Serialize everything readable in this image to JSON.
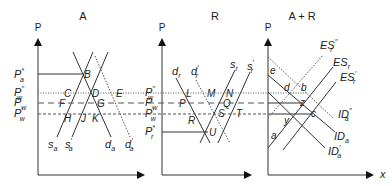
{
  "panels": [
    {
      "id": "A",
      "title": "A",
      "y_axis_label": "P"
    },
    {
      "id": "R",
      "title": "R",
      "y_axis_label": "P"
    },
    {
      "id": "AR",
      "title": "A + R",
      "y_axis_label": "P",
      "x_axis_label": "x"
    }
  ],
  "price_levels": {
    "Pa_star": {
      "base": "P",
      "sup": "*",
      "sub": "a"
    },
    "Pw_dd": {
      "base": "P",
      "sup": "′′",
      "sub": "w"
    },
    "Pw": {
      "base": "P",
      "sub": "w"
    },
    "Pw_d": {
      "base": "P",
      "sup": "′",
      "sub": "w"
    },
    "Pr_star": {
      "base": "P",
      "sup": "*",
      "sub": "r"
    }
  },
  "panel_A": {
    "points": [
      "B",
      "C",
      "D",
      "E",
      "F",
      "G",
      "H",
      "J",
      "K"
    ],
    "curves": [
      "s_a",
      "s_a′",
      "d_a",
      "d_a′"
    ],
    "curve_labels": {
      "sa": {
        "base": "s",
        "sub": "a"
      },
      "sa_p": {
        "base": "s",
        "sub": "a",
        "sup": "′"
      },
      "da": {
        "base": "d",
        "sub": "a"
      },
      "da_p": {
        "base": "d",
        "sub": "a",
        "sup": "′"
      }
    }
  },
  "panel_R": {
    "points": [
      "L",
      "M",
      "N",
      "P",
      "Q",
      "R",
      "S",
      "T",
      "U"
    ],
    "curve_labels": {
      "dr": {
        "base": "d",
        "sub": "r"
      },
      "dr_p": {
        "base": "d",
        "sub": "r",
        "sup": "′"
      },
      "sr": {
        "base": "s",
        "sub": "r"
      },
      "sr_p": {
        "base": "s",
        "sub": "r",
        "sup": "′"
      }
    }
  },
  "panel_AR": {
    "points": [
      "e",
      "d",
      "b",
      "z",
      "c",
      "y",
      "a"
    ],
    "curve_labels": {
      "ESr_dd": {
        "base": "ES",
        "sub": "r",
        "sup": "′′"
      },
      "ESr": {
        "base": "ES",
        "sub": "r"
      },
      "ESr_p": {
        "base": "ES",
        "sub": "r",
        "sup": "′"
      },
      "IDa_dd": {
        "base": "ID",
        "sub": "a",
        "sup": "′′"
      },
      "IDa": {
        "base": "ID",
        "sub": "a"
      },
      "IDa_p": {
        "base": "ID",
        "sub": "a",
        "sup": "′"
      }
    }
  }
}
